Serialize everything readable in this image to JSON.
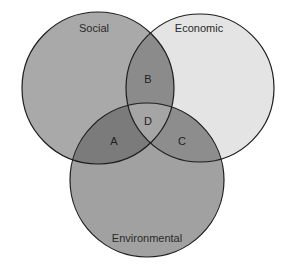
{
  "diagram": {
    "type": "venn",
    "circles": [
      {
        "id": "social",
        "label": "Social",
        "cx": 98,
        "cy": 88,
        "r": 76,
        "fill": "#a9a9a9"
      },
      {
        "id": "economic",
        "label": "Economic",
        "cx": 200,
        "cy": 88,
        "r": 74,
        "fill": "#e4e4e4"
      },
      {
        "id": "environmental",
        "label": "Environmental",
        "cx": 147,
        "cy": 180,
        "r": 77,
        "fill": "#a1a1a1"
      }
    ],
    "regions": [
      {
        "id": "A",
        "label": "A",
        "between": [
          "social",
          "environmental"
        ],
        "fill": "#7b7b7b"
      },
      {
        "id": "B",
        "label": "B",
        "between": [
          "social",
          "economic"
        ],
        "fill": "#8b8b8b"
      },
      {
        "id": "C",
        "label": "C",
        "between": [
          "economic",
          "environmental"
        ],
        "fill": "#8d8d8d"
      },
      {
        "id": "D",
        "label": "D",
        "between": [
          "social",
          "economic",
          "environmental"
        ],
        "fill": "#a5a5a5"
      }
    ],
    "stroke": "#1e1e1e"
  }
}
